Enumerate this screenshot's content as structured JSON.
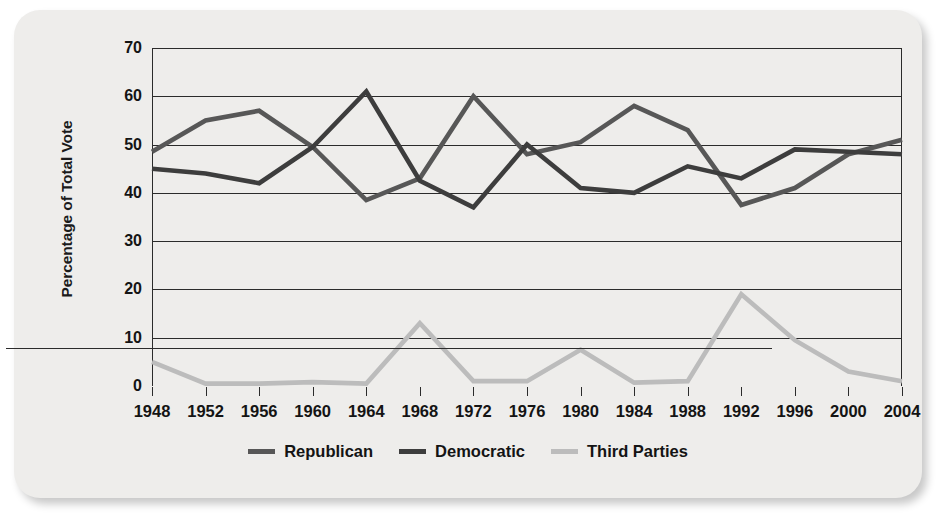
{
  "chart_data": {
    "type": "line",
    "title": "",
    "xlabel": "",
    "ylabel": "Percentage of Total Vote",
    "categories": [
      "1948",
      "1952",
      "1956",
      "1960",
      "1964",
      "1968",
      "1972",
      "1976",
      "1980",
      "1984",
      "1988",
      "1992",
      "1996",
      "2000",
      "2004"
    ],
    "ylim": [
      0,
      70
    ],
    "yticks": [
      0,
      10,
      20,
      30,
      40,
      50,
      60,
      70
    ],
    "grid": true,
    "legend_position": "bottom-center",
    "series": [
      {
        "name": "Republican",
        "color": "#575757",
        "values": [
          48.5,
          55,
          57,
          49.5,
          38.5,
          43,
          60,
          48,
          50.5,
          58,
          53,
          37.5,
          41,
          48,
          51
        ]
      },
      {
        "name": "Democratic",
        "color": "#3d3d3d",
        "values": [
          45,
          44,
          42,
          49.5,
          61,
          42.5,
          37,
          50,
          41,
          40,
          45.5,
          43,
          49,
          48.5,
          48
        ]
      },
      {
        "name": "Third Parties",
        "color": "#bcbcbc",
        "values": [
          5,
          0.5,
          0.5,
          0.8,
          0.5,
          13,
          1,
          1,
          7.5,
          0.7,
          1,
          19,
          9.5,
          3,
          1
        ]
      }
    ]
  },
  "axis": {
    "y_title": "Percentage of Total Vote",
    "y_tick_labels": [
      "70",
      "60",
      "50",
      "40",
      "30",
      "20",
      "10",
      "0"
    ],
    "x_tick_labels": [
      "1948",
      "1952",
      "1956",
      "1960",
      "1964",
      "1968",
      "1972",
      "1976",
      "1980",
      "1984",
      "1988",
      "1992",
      "1996",
      "2000",
      "2004"
    ]
  },
  "legend": {
    "items": [
      {
        "label": "Republican",
        "color": "#575757"
      },
      {
        "label": "Democratic",
        "color": "#3d3d3d"
      },
      {
        "label": "Third Parties",
        "color": "#bcbcbc"
      }
    ]
  }
}
